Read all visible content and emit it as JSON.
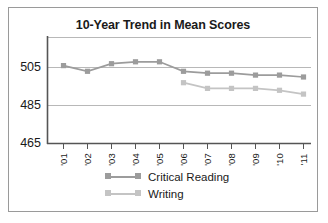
{
  "chart_data": {
    "type": "line",
    "title": "10-Year Trend in Mean Scores",
    "xlabel": "",
    "ylabel": "",
    "categories": [
      "'01",
      "'02",
      "'03",
      "'04",
      "'05",
      "'06",
      "'07",
      "'08",
      "'09",
      "'10",
      "'11"
    ],
    "yticks": [
      465,
      485,
      505
    ],
    "ylim": [
      465,
      513
    ],
    "grid": true,
    "legend_position": "bottom",
    "series": [
      {
        "name": "Critical Reading",
        "color": "#9c9c9c",
        "x": [
          "'01",
          "'02",
          "'03",
          "'04",
          "'05",
          "'06",
          "'07",
          "'08",
          "'09",
          "'10",
          "'11"
        ],
        "values": [
          506,
          503,
          507,
          508,
          508,
          503,
          502,
          502,
          501,
          501,
          500
        ]
      },
      {
        "name": "Writing",
        "color": "#c4c4c4",
        "x": [
          "'06",
          "'07",
          "'08",
          "'09",
          "'10",
          "'11"
        ],
        "values": [
          497,
          494,
          494,
          494,
          493,
          491
        ]
      }
    ]
  },
  "legend": {
    "items": [
      {
        "label": "Critical Reading",
        "color": "#9c9c9c"
      },
      {
        "label": "Writing",
        "color": "#c4c4c4"
      }
    ]
  },
  "axis": {
    "y_tick_labels": [
      "505",
      "485",
      "465"
    ],
    "x_tick_labels": [
      "'01",
      "'02",
      "'03",
      "'04",
      "'05",
      "'06",
      "'07",
      "'08",
      "'09",
      "'10",
      "'11"
    ]
  },
  "colors": {
    "frame": "#9a9a9a",
    "axis": "#5a5a5a",
    "grid": "#b8b8b8",
    "text": "#1a1a1a",
    "series_critical_reading": "#9c9c9c",
    "series_writing": "#c4c4c4"
  }
}
